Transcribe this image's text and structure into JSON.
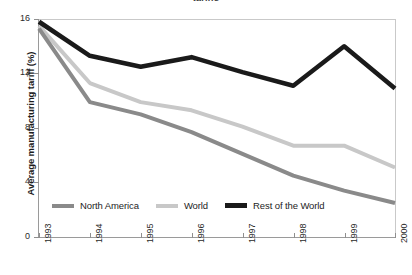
{
  "title_partial": "tariffs",
  "axes": {
    "y_title": "Average manufacturing tariff (%)",
    "y_ticks": [
      "0",
      "4",
      "8",
      "12",
      "16"
    ],
    "x_ticks": [
      "1993",
      "1994",
      "1995",
      "1996",
      "1997",
      "1998",
      "1999",
      "2000"
    ]
  },
  "legend": {
    "items": [
      {
        "label": "North America",
        "color": "#8a8a8a"
      },
      {
        "label": "World",
        "color": "#c8c8c8"
      },
      {
        "label": "Rest of the World",
        "color": "#1a1a1a"
      }
    ]
  },
  "chart_data": {
    "type": "line",
    "title": "",
    "xlabel": "",
    "ylabel": "Average manufacturing tariff (%)",
    "categories": [
      "1993",
      "1994",
      "1995",
      "1996",
      "1997",
      "1998",
      "1999",
      "2000"
    ],
    "x": [
      1993,
      1994,
      1995,
      1996,
      1997,
      1998,
      1999,
      2000
    ],
    "ylim": [
      0,
      16
    ],
    "yticks": [
      0,
      4,
      8,
      12,
      16
    ],
    "grid": false,
    "legend_position": "inside-bottom-left",
    "series": [
      {
        "name": "North America",
        "color": "#8a8a8a",
        "values": [
          15.3,
          9.9,
          9.0,
          7.7,
          6.1,
          4.5,
          3.4,
          2.5
        ]
      },
      {
        "name": "World",
        "color": "#c8c8c8",
        "values": [
          15.5,
          11.3,
          9.9,
          9.3,
          8.1,
          6.7,
          6.7,
          5.1
        ]
      },
      {
        "name": "Rest of the World",
        "color": "#1a1a1a",
        "values": [
          15.8,
          13.3,
          12.5,
          13.2,
          12.1,
          11.1,
          14.0,
          10.9
        ]
      }
    ]
  }
}
